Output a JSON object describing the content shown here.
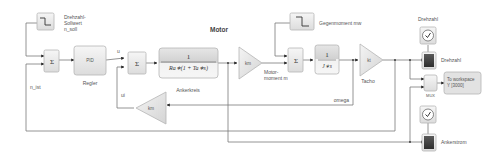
{
  "diagram": {
    "title": "Motor",
    "blocks": {
      "step_setpoint": {
        "label": "Drehzahl-\nSollwert\nn_soll",
        "lines": [
          "Drehzahl-",
          "Sollwert",
          "n_soll"
        ],
        "icon": "step-icon"
      },
      "sum1": {
        "symbol": "Σ"
      },
      "controller": {
        "text": "PID",
        "label": "Regler"
      },
      "sum2": {
        "symbol": "Σ"
      },
      "armature": {
        "numerator": "1",
        "denominator": "Ra∗(1 + Ta∗s)",
        "label": "Ankerkreis"
      },
      "gain_km": {
        "text": "km",
        "label_lines": [
          "Motor-",
          "moment m"
        ]
      },
      "step_load": {
        "label": "Gegenmoment mw",
        "icon": "step-icon"
      },
      "sum3": {
        "symbol": "Σ"
      },
      "integrator": {
        "numerator": "1",
        "denominator": "J∗s"
      },
      "tacho": {
        "text": "kt",
        "label": "Tacho"
      },
      "gain_emf": {
        "text": "km"
      },
      "scope_speed": {
        "label": "Drehzahl",
        "clock_label": "Drehzahl"
      },
      "mux": {
        "label": "MUX"
      },
      "to_workspace": {
        "lines": [
          "To workspace",
          "Y [3000]"
        ]
      },
      "scope_current": {
        "label": "Ankerstrom"
      }
    },
    "signals": {
      "u": "u",
      "ui": "ui",
      "n_ist": "n_ist",
      "omega": "omega"
    }
  }
}
